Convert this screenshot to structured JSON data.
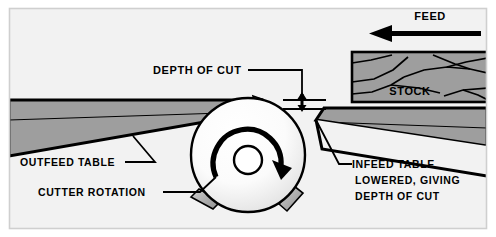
{
  "diagram": {
    "background_color": "#f2f2f2",
    "frame_color": "#cfcfcf",
    "table_fill": "#9e9e9e",
    "stock_fill": "#9e9e9e",
    "knife_fill": "#a8a8a8",
    "line_color": "#000000",
    "labels": {
      "feed": "FEED",
      "stock": "STOCK",
      "depth_of_cut": "DEPTH OF CUT",
      "outfeed_table": "OUTFEED TABLE",
      "cutter_rotation": "CUTTER ROTATION",
      "infeed_line_1": "INFEED TABLE",
      "infeed_line_2": "LOWERED, GIVING",
      "infeed_line_3": "DEPTH OF CUT"
    },
    "icons": {
      "feed_arrow": "left-arrow-icon",
      "rotation_arrow": "clockwise-rotation-arrow-icon",
      "depth_arrow": "vertical-double-arrow-icon"
    },
    "parts": {
      "cutterhead": "cutter-head-circle",
      "arbor": "arbor-hole",
      "knives": [
        "knife-top",
        "knife-lower-left",
        "knife-lower-right"
      ]
    }
  }
}
